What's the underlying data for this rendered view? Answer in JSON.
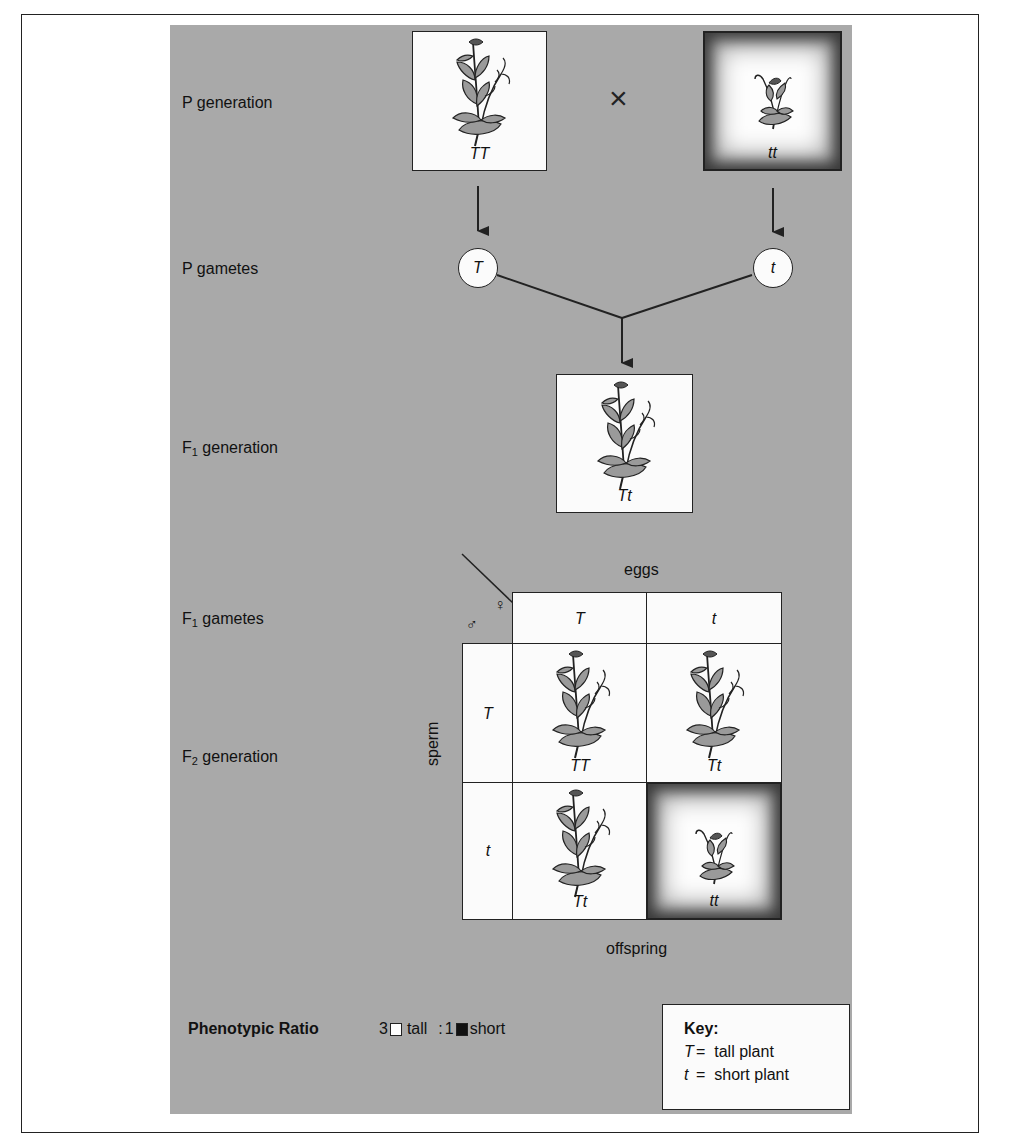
{
  "figure": {
    "colors": {
      "panel_bg": "#a9a9a9",
      "box_bg": "#fbfbfb",
      "line": "#222222",
      "leaf": "#9a9a9a"
    }
  },
  "rows": {
    "p_generation": {
      "prefix": "P",
      "text": " generation"
    },
    "p_gametes": {
      "prefix": "P",
      "text": " gametes"
    },
    "f1_generation": {
      "prefix": "F",
      "sub": "1",
      "text": " generation"
    },
    "f1_gametes": {
      "prefix": "F",
      "sub": "1",
      "text": " gametes"
    },
    "f2_generation": {
      "prefix": "F",
      "sub": "2",
      "text": " generation"
    }
  },
  "p_generation": {
    "parent_left": {
      "genotype": "TT",
      "phenotype": "tall",
      "icon": "tall-plant-icon"
    },
    "cross_symbol": "×",
    "parent_right": {
      "genotype": "tt",
      "phenotype": "short",
      "icon": "short-plant-icon"
    }
  },
  "p_gametes": {
    "left": "T",
    "right": "t"
  },
  "f1_generation": {
    "genotype": "Tt",
    "phenotype": "tall"
  },
  "punnett": {
    "top_label": "eggs",
    "side_label": "sperm",
    "bottom_label": "offspring",
    "female_symbol": "♀",
    "male_symbol": "♂",
    "columns": [
      "T",
      "t"
    ],
    "rows": [
      "T",
      "t"
    ],
    "cells": [
      [
        {
          "genotype": "TT",
          "phenotype": "tall"
        },
        {
          "genotype": "Tt",
          "phenotype": "tall"
        }
      ],
      [
        {
          "genotype": "Tt",
          "phenotype": "tall"
        },
        {
          "genotype": "tt",
          "phenotype": "short"
        }
      ]
    ]
  },
  "phenotypic_ratio": {
    "label": "Phenotypic Ratio",
    "tall_count": "3",
    "tall_label": "tall",
    "separator": ":",
    "short_count": "1",
    "short_label": "short"
  },
  "key": {
    "title": "Key:",
    "entries": [
      {
        "symbol": "T",
        "eq": "=",
        "meaning": "tall plant"
      },
      {
        "symbol": "t",
        "eq": "=",
        "meaning": "short plant"
      }
    ]
  }
}
